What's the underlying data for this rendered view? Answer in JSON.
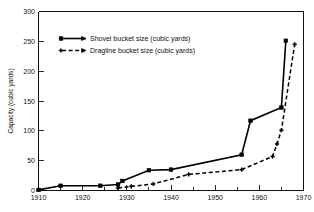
{
  "chart_data": {
    "type": "line",
    "title": "",
    "subtitle": "",
    "xlabel": "",
    "ylabel": "Capacity (cubic yards)",
    "xlim": [
      1910,
      1970
    ],
    "ylim": [
      0,
      300
    ],
    "xticks": [
      1910,
      1920,
      1930,
      1940,
      1950,
      1960,
      1970
    ],
    "xticklabels": [
      "1910",
      "1920",
      "1930",
      "1940",
      "1950",
      "1960",
      "1970"
    ],
    "xminorticks": [
      1915,
      1925,
      1935,
      1945,
      1955,
      1965
    ],
    "yticks": [
      0,
      50,
      100,
      150,
      200,
      250,
      300
    ],
    "yticklabels": [
      "0",
      "50",
      "100",
      "150",
      "200",
      "250",
      "300"
    ],
    "grid": false,
    "legend_position": "upper left",
    "series": [
      {
        "name": "Shovel bucket size (cubic yards)",
        "style": "solid",
        "marker": "square",
        "color": "#000000",
        "x": [
          1910,
          1915,
          1924,
          1928,
          1929,
          1935,
          1940,
          1956,
          1958,
          1965,
          1966
        ],
        "y": [
          1,
          8,
          8,
          10,
          16,
          34,
          35,
          60,
          117,
          139,
          251
        ]
      },
      {
        "name": "Dragline bucket size (cubic yards)",
        "style": "dashed",
        "marker": "plus",
        "color": "#000000",
        "x": [
          1928,
          1931,
          1936,
          1944,
          1956,
          1963,
          1964,
          1965,
          1968
        ],
        "y": [
          4,
          7,
          11,
          27,
          35,
          57,
          78,
          101,
          245
        ]
      }
    ]
  },
  "legend": {
    "entries": [
      {
        "label": "Shovel bucket size (cubic yards)",
        "style": "solid",
        "marker": "square"
      },
      {
        "label": "Dragline bucket size (cubic yards)",
        "style": "dashed",
        "marker": "plus"
      }
    ]
  },
  "axes": {
    "y_title": "Capacity (cubic yards)",
    "y_labels": [
      "300",
      "250",
      "200",
      "150",
      "100",
      "50",
      "0"
    ],
    "x_labels": [
      "1910",
      "1920",
      "1930",
      "1940",
      "1950",
      "1960",
      "1970"
    ]
  },
  "colors": {
    "background": "#ffffff",
    "ink": "#111111",
    "series": "#000000"
  }
}
